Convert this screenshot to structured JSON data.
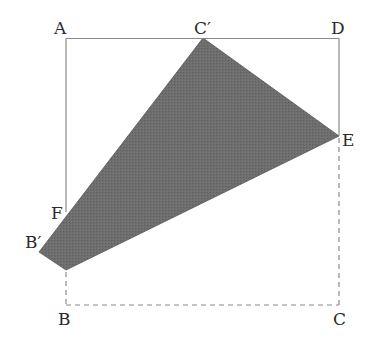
{
  "diagram": {
    "type": "geometry-folding-figure",
    "colors": {
      "solid_line": "#8a8a8a",
      "dashed_line": "#8a8a8a",
      "shade_fill": "#6b6b6b",
      "label": "#2a2a2a",
      "background": "#ffffff"
    },
    "points": {
      "A": {
        "label": "A",
        "x": 66,
        "y": 38
      },
      "D": {
        "label": "D",
        "x": 339,
        "y": 38
      },
      "B": {
        "label": "B",
        "x": 66,
        "y": 305
      },
      "C": {
        "label": "C",
        "x": 339,
        "y": 305
      },
      "C_prime": {
        "label": "C′",
        "x": 203,
        "y": 38
      },
      "E": {
        "label": "E",
        "x": 339,
        "y": 136
      },
      "F": {
        "label": "F",
        "x": 66,
        "y": 212
      },
      "B_prime": {
        "label": "B′",
        "x": 39,
        "y": 252
      },
      "G": {
        "label": "",
        "x": 66,
        "y": 270
      }
    },
    "labels": {
      "A": "A",
      "C_prime": "C′",
      "D": "D",
      "E": "E",
      "F": "F",
      "B_prime": "B′",
      "B": "B",
      "C": "C"
    },
    "solid_segments": [
      [
        "A",
        "D"
      ],
      [
        "D",
        "E"
      ],
      [
        "A",
        "F"
      ]
    ],
    "dashed_segments": [
      [
        "G",
        "B"
      ],
      [
        "B",
        "C"
      ],
      [
        "C",
        "E"
      ]
    ],
    "shaded_polygon": [
      "C_prime",
      "E",
      "G",
      "B_prime"
    ]
  }
}
